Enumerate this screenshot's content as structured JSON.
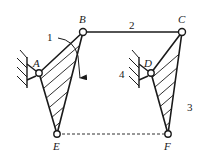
{
  "diagram": {
    "title": "",
    "joints": [
      {
        "id": "A",
        "label": "A",
        "x": 39,
        "y": 73,
        "lx": 33,
        "ly": 67
      },
      {
        "id": "B",
        "label": "B",
        "x": 83,
        "y": 32,
        "lx": 79,
        "ly": 23
      },
      {
        "id": "C",
        "label": "C",
        "x": 182,
        "y": 32,
        "lx": 178,
        "ly": 23
      },
      {
        "id": "D",
        "label": "D",
        "x": 151,
        "y": 73,
        "lx": 144,
        "ly": 67
      },
      {
        "id": "E",
        "label": "E",
        "x": 57,
        "y": 134,
        "lx": 53,
        "ly": 150
      },
      {
        "id": "F",
        "label": "F",
        "x": 168,
        "y": 134,
        "lx": 164,
        "ly": 150
      }
    ],
    "links": [
      {
        "id": "1",
        "label": "1",
        "members": [
          "A",
          "B",
          "E"
        ],
        "lx": 47,
        "ly": 41
      },
      {
        "id": "2",
        "label": "2",
        "members": [
          "B",
          "C"
        ],
        "lx": 129,
        "ly": 29
      },
      {
        "id": "3",
        "label": "3",
        "members": [
          "C",
          "D",
          "F"
        ],
        "lx": 187,
        "ly": 111
      },
      {
        "id": "4",
        "label": "4",
        "members": [
          "D",
          "ground"
        ],
        "lx": 119,
        "ly": 78
      }
    ],
    "dashed_line": {
      "from": "E",
      "to": "F"
    },
    "rotation_arrow": {
      "link": "1",
      "direction": "clockwise"
    },
    "colors": {
      "stroke": "#1a1a1a",
      "background": "#ffffff"
    }
  }
}
